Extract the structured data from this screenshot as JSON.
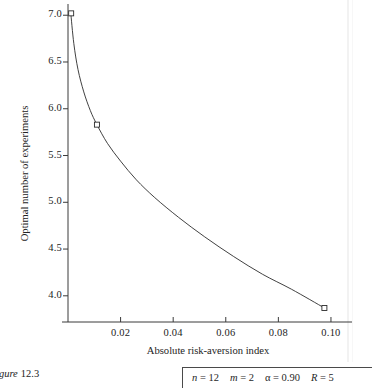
{
  "chart_data": {
    "type": "line",
    "title": "",
    "xlabel": "Absolute risk-aversion index",
    "ylabel": "Optimal number of experiments",
    "xlim": [
      0.0,
      0.108
    ],
    "ylim": [
      3.72,
      7.12
    ],
    "xticks": [
      0.02,
      0.04,
      0.06,
      0.08,
      0.1
    ],
    "xtick_labels": [
      "0.02",
      "0.04",
      "0.06",
      "0.08",
      "0.10"
    ],
    "yticks": [
      4.0,
      4.5,
      5.0,
      5.5,
      6.0,
      6.5,
      7.0
    ],
    "ytick_labels": [
      "4.0",
      "4.5",
      "5.0",
      "5.5",
      "6.0",
      "6.5",
      "7.0"
    ],
    "grid": false,
    "legend": null,
    "series": [
      {
        "name": "Optimal number of experiments",
        "marker": "open-square",
        "marker_points": [
          {
            "x": 0.0012,
            "y": 7.02
          },
          {
            "x": 0.011,
            "y": 5.83
          },
          {
            "x": 0.0975,
            "y": 3.87
          }
        ],
        "curve_points": [
          {
            "x": 0.001,
            "y": 7.04
          },
          {
            "x": 0.0022,
            "y": 6.7
          },
          {
            "x": 0.0038,
            "y": 6.42
          },
          {
            "x": 0.006,
            "y": 6.18
          },
          {
            "x": 0.0085,
            "y": 5.98
          },
          {
            "x": 0.011,
            "y": 5.83
          },
          {
            "x": 0.015,
            "y": 5.63
          },
          {
            "x": 0.02,
            "y": 5.44
          },
          {
            "x": 0.026,
            "y": 5.24
          },
          {
            "x": 0.033,
            "y": 5.05
          },
          {
            "x": 0.042,
            "y": 4.84
          },
          {
            "x": 0.052,
            "y": 4.63
          },
          {
            "x": 0.063,
            "y": 4.42
          },
          {
            "x": 0.074,
            "y": 4.23
          },
          {
            "x": 0.085,
            "y": 4.07
          },
          {
            "x": 0.0975,
            "y": 3.87
          }
        ]
      }
    ]
  },
  "caption": {
    "label": "igure",
    "number": "12.3"
  },
  "param_box": {
    "items": [
      {
        "symbol": "n",
        "eq": "=",
        "value": "12",
        "italic": true
      },
      {
        "symbol": "m",
        "eq": "=",
        "value": "2",
        "italic": true
      },
      {
        "symbol": "α",
        "eq": "=",
        "value": "0.90",
        "italic": false
      },
      {
        "symbol": "R",
        "eq": "=",
        "value": "5",
        "italic": true
      }
    ]
  },
  "colors": {
    "ink": "#232323",
    "axis": "#3a3a3a",
    "curve": "#2b2b2b",
    "background": "#ffffff"
  }
}
